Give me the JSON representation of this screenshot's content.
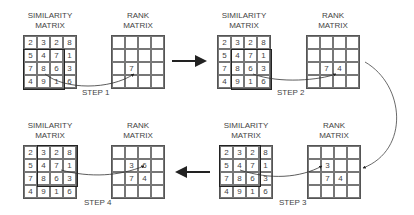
{
  "labels": {
    "similarity_line1": "SIMILARITY",
    "similarity_line2": "MATRIX",
    "rank_line1": "RANK",
    "rank_line2": "MATRIX"
  },
  "similarity_matrix": [
    [
      "2",
      "3",
      "2",
      "8"
    ],
    [
      "5",
      "4",
      "7",
      "1"
    ],
    [
      "7",
      "8",
      "6",
      "3"
    ],
    [
      "4",
      "9",
      "1",
      "6"
    ]
  ],
  "steps": [
    {
      "label": "STEP 1",
      "window": {
        "row": 1,
        "col": 0,
        "size": 3
      },
      "selected_value": "8",
      "rank_matrix": [
        [
          "",
          "",
          "",
          ""
        ],
        [
          "",
          "",
          "",
          ""
        ],
        [
          "",
          "7",
          "",
          ""
        ],
        [
          "",
          "",
          "",
          ""
        ]
      ]
    },
    {
      "label": "STEP 2",
      "window": {
        "row": 1,
        "col": 1,
        "size": 3
      },
      "selected_value": "6",
      "rank_matrix": [
        [
          "",
          "",
          "",
          ""
        ],
        [
          "",
          "",
          "",
          ""
        ],
        [
          "",
          "7",
          "4",
          ""
        ],
        [
          "",
          "",
          "",
          ""
        ]
      ]
    },
    {
      "label": "STEP 3",
      "window": {
        "row": 0,
        "col": 0,
        "size": 3
      },
      "selected_value": "4",
      "rank_matrix": [
        [
          "",
          "",
          "",
          ""
        ],
        [
          "",
          "3",
          "",
          ""
        ],
        [
          "",
          "7",
          "4",
          ""
        ],
        [
          "",
          "",
          "",
          ""
        ]
      ]
    },
    {
      "label": "STEP 4",
      "window": {
        "row": 0,
        "col": 1,
        "size": 3
      },
      "selected_value": "7",
      "rank_matrix": [
        [
          "",
          "",
          "",
          ""
        ],
        [
          "",
          "3",
          "6",
          ""
        ],
        [
          "",
          "7",
          "4",
          ""
        ],
        [
          "",
          "",
          "",
          ""
        ]
      ]
    }
  ],
  "colors": {
    "line": "#222222",
    "grid": "#777777",
    "text": "#444444"
  }
}
